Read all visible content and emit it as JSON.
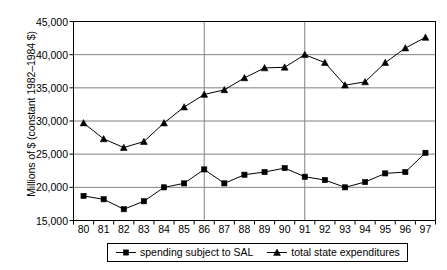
{
  "chart_data": {
    "type": "line",
    "title": "",
    "xlabel": "",
    "ylabel": "Millions of $ (constant 1982–1984 $)",
    "categories": [
      "80",
      "81",
      "82",
      "83",
      "84",
      "85",
      "86",
      "87",
      "88",
      "89",
      "90",
      "91",
      "92",
      "93",
      "94",
      "95",
      "96",
      "97"
    ],
    "x_tick_labels": [
      "80",
      "81",
      "82",
      "83",
      "84",
      "85",
      "86",
      "87",
      "88",
      "89",
      "90",
      "91",
      "92",
      "93",
      "94",
      "95",
      "96",
      "97"
    ],
    "y_tick_labels": [
      "45,000",
      "40,000",
      "35,000",
      "30,000",
      "25,000",
      "20,000",
      "15,000"
    ],
    "y_ticks": [
      45000,
      40000,
      35000,
      30000,
      25000,
      20000,
      15000
    ],
    "ylim": [
      15000,
      45000
    ],
    "grid": {
      "horizontal": true,
      "vertical_at": [
        "86",
        "91"
      ],
      "color": "#808080"
    },
    "legend": {
      "position": "bottom",
      "entries": [
        {
          "name": "spending subject to SAL",
          "marker": "square",
          "color": "#000000"
        },
        {
          "name": "total state expenditures",
          "marker": "triangle",
          "color": "#000000"
        }
      ]
    },
    "series": [
      {
        "name": "total state expenditures",
        "marker": "triangle",
        "color": "#000000",
        "values": [
          29700,
          27300,
          26000,
          26900,
          29700,
          32100,
          34000,
          34700,
          36500,
          38000,
          38100,
          40000,
          38800,
          35400,
          35900,
          38800,
          41000,
          42600
        ]
      },
      {
        "name": "spending subject to SAL",
        "marker": "square",
        "color": "#000000",
        "values": [
          18700,
          18200,
          16700,
          17900,
          20000,
          20600,
          22700,
          20600,
          21900,
          22300,
          22900,
          21600,
          21100,
          20000,
          20800,
          22100,
          22300,
          25200
        ]
      }
    ]
  }
}
